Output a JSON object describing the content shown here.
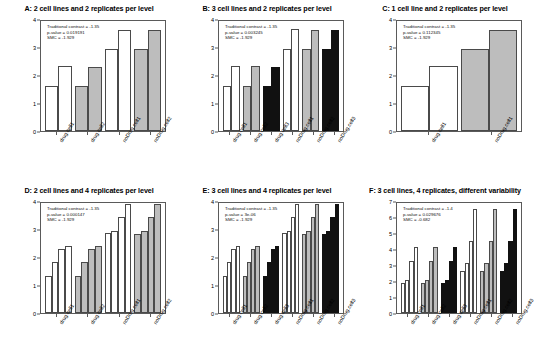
{
  "figure": {
    "y_axis_label": "Measured phenotypic effect",
    "annotation_labels": {
      "contrast": "Traditional contrast = ",
      "pvalue": "p-value = ",
      "smc": "SMC = "
    }
  },
  "chart_data": [
    {
      "panel": "A",
      "type": "bar",
      "title": "A: 2 cell lines and 2 replicates per level",
      "xlabel": "",
      "ylabel": "Measured phenotypic effect",
      "ylim": [
        0,
        4
      ],
      "yticks": [
        0,
        1,
        2,
        3,
        4
      ],
      "grid": false,
      "annotations": {
        "traditional_contrast": "-1.35",
        "p_value": "0.019191",
        "smc": "-1.929"
      },
      "groups": [
        "drug.cell1",
        "drug.cell2",
        "noDrug.cell1",
        "noDrug.cell2"
      ],
      "group_fills": [
        "white",
        "gray",
        "white",
        "gray"
      ],
      "values": [
        1.65,
        2.35,
        1.65,
        2.33,
        3.0,
        3.68,
        3.0,
        3.67
      ],
      "fills": [
        "white",
        "white",
        "gray",
        "gray",
        "white",
        "white",
        "gray",
        "gray"
      ]
    },
    {
      "panel": "B",
      "type": "bar",
      "title": "B: 3 cell lines and 2 replicates per level",
      "xlabel": "",
      "ylabel": "Measured phenotypic effect",
      "ylim": [
        0,
        4
      ],
      "yticks": [
        0,
        1,
        2,
        3,
        4
      ],
      "grid": false,
      "annotations": {
        "traditional_contrast": "-1.35",
        "p_value": "0.003245",
        "smc": "-1.929"
      },
      "groups": [
        "drug.cell1",
        "drug.cell2",
        "drug.cell3",
        "noDrug.cell1",
        "noDrug.cell2",
        "noDrug.cell3"
      ],
      "group_fills": [
        "white",
        "gray",
        "black",
        "white",
        "gray",
        "black"
      ],
      "values": [
        1.65,
        2.35,
        1.65,
        2.35,
        1.65,
        2.33,
        3.0,
        3.7,
        3.0,
        3.68,
        3.0,
        3.67
      ],
      "fills": [
        "white",
        "white",
        "gray",
        "gray",
        "black",
        "black",
        "white",
        "white",
        "gray",
        "gray",
        "black",
        "black"
      ]
    },
    {
      "panel": "C",
      "type": "bar",
      "title": "C: 1 cell line and 2 replicates per level",
      "xlabel": "",
      "ylabel": "Measured phenotypic effect",
      "ylim": [
        0,
        4
      ],
      "yticks": [
        0,
        1,
        2,
        3,
        4
      ],
      "grid": false,
      "annotations": {
        "traditional_contrast": "-1.35",
        "p_value": "0.112345",
        "smc": "-1.929"
      },
      "groups": [
        "drug.cell1",
        "noDrug.cell1"
      ],
      "group_fills": [
        "white",
        "gray"
      ],
      "values": [
        1.65,
        2.35,
        3.0,
        3.68
      ],
      "fills": [
        "white",
        "white",
        "gray",
        "gray"
      ]
    },
    {
      "panel": "D",
      "type": "bar",
      "title": "D: 2 cell lines and 4 replicates per level",
      "xlabel": "",
      "ylabel": "Measured phenotypic effect",
      "ylim": [
        0,
        4
      ],
      "yticks": [
        0,
        1,
        2,
        3,
        4
      ],
      "grid": false,
      "annotations": {
        "traditional_contrast": "-1.35",
        "p_value": "0.000147",
        "smc": "-1.929"
      },
      "groups": [
        "drug.cell1",
        "drug.cell2",
        "noDrug.cell1",
        "noDrug.cell2"
      ],
      "group_fills": [
        "white",
        "gray",
        "white",
        "gray"
      ],
      "values": [
        1.35,
        1.85,
        2.33,
        2.42,
        1.35,
        1.85,
        2.33,
        2.42,
        2.9,
        3.0,
        3.5,
        3.97,
        2.88,
        3.0,
        3.5,
        3.97
      ],
      "fills": [
        "white",
        "white",
        "white",
        "white",
        "gray",
        "gray",
        "gray",
        "gray",
        "white",
        "white",
        "white",
        "white",
        "gray",
        "gray",
        "gray",
        "gray"
      ]
    },
    {
      "panel": "E",
      "type": "bar",
      "title": "E: 3 cell lines and 4 replicates per level",
      "xlabel": "",
      "ylabel": "Measured phenotypic effect",
      "ylim": [
        0,
        4
      ],
      "yticks": [
        0,
        1,
        2,
        3,
        4
      ],
      "grid": false,
      "annotations": {
        "traditional_contrast": "-1.35",
        "p_value": "3e-06",
        "smc": "-1.929"
      },
      "groups": [
        "drug.cell1",
        "drug.cell2",
        "drug.cell3",
        "noDrug.cell1",
        "noDrug.cell2",
        "noDrug.cell3"
      ],
      "group_fills": [
        "white",
        "gray",
        "black",
        "white",
        "gray",
        "black"
      ],
      "values": [
        1.35,
        1.85,
        2.33,
        2.42,
        1.35,
        1.85,
        2.33,
        2.42,
        1.35,
        1.85,
        2.33,
        2.42,
        2.9,
        3.0,
        3.5,
        3.97,
        2.88,
        3.0,
        3.5,
        3.97,
        2.88,
        3.0,
        3.5,
        3.97
      ],
      "fills": [
        "white",
        "white",
        "white",
        "white",
        "gray",
        "gray",
        "gray",
        "gray",
        "black",
        "black",
        "black",
        "black",
        "white",
        "white",
        "white",
        "white",
        "gray",
        "gray",
        "gray",
        "gray",
        "black",
        "black",
        "black",
        "black"
      ]
    },
    {
      "panel": "F",
      "type": "bar",
      "title": "F: 3 cell lines, 4 replicates, different variability",
      "xlabel": "",
      "ylabel": "Measured phenotypic effect",
      "ylim": [
        0,
        7
      ],
      "yticks": [
        0,
        1,
        2,
        3,
        4,
        5,
        6,
        7
      ],
      "grid": false,
      "annotations": {
        "traditional_contrast": "-1.4",
        "p_value": "0.029676",
        "smc": "-0.682"
      },
      "groups": [
        "drug.cell1",
        "drug.cell2",
        "drug.cell3",
        "noDrug.cell1",
        "noDrug.cell2",
        "noDrug.cell3"
      ],
      "group_fills": [
        "white",
        "gray",
        "black",
        "white",
        "gray",
        "black"
      ],
      "values": [
        1.9,
        2.1,
        3.3,
        4.2,
        1.9,
        2.1,
        3.3,
        4.2,
        1.9,
        2.1,
        3.3,
        4.2,
        2.7,
        3.2,
        4.6,
        6.6,
        2.7,
        3.2,
        4.6,
        6.6,
        2.7,
        3.2,
        4.6,
        6.6
      ],
      "fills": [
        "white",
        "white",
        "white",
        "white",
        "gray",
        "gray",
        "gray",
        "gray",
        "black",
        "black",
        "black",
        "black",
        "white",
        "white",
        "white",
        "white",
        "gray",
        "gray",
        "gray",
        "gray",
        "black",
        "black",
        "black",
        "black"
      ]
    }
  ]
}
